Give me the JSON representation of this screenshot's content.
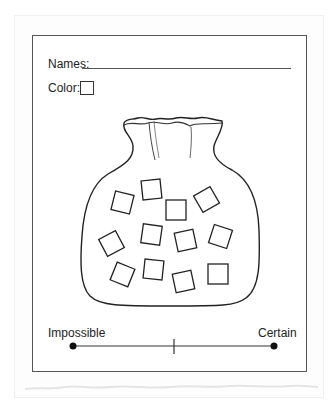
{
  "worksheet": {
    "names_label": "Names:",
    "color_label": "Color:",
    "color_box_value": "",
    "names_value": ""
  },
  "illustration": {
    "subject": "bag-of-squares",
    "square_count": 12
  },
  "probability_scale": {
    "left_label": "Impossible",
    "right_label": "Certain",
    "has_midpoint_tick": true
  },
  "colors": {
    "line": "#333333",
    "frame": "#555555",
    "background": "#ffffff"
  }
}
